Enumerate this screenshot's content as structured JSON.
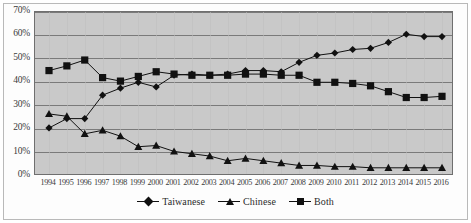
{
  "chart_data": {
    "type": "line",
    "title": "",
    "subtitle": "",
    "xlabel": "",
    "ylabel": "",
    "ylim": [
      0,
      70
    ],
    "ytick_step": 10,
    "ytick_labels": [
      "0%",
      "10%",
      "20%",
      "30%",
      "40%",
      "50%",
      "60%",
      "70%"
    ],
    "ytick_values": [
      0,
      10,
      20,
      30,
      40,
      50,
      60,
      70
    ],
    "grid": "horizontal",
    "legend_position": "bottom-center",
    "categories": [
      "1994",
      "1995",
      "1996",
      "1997",
      "1998",
      "1999",
      "2000",
      "2001",
      "2002",
      "2003",
      "2004",
      "2005",
      "2006",
      "2007",
      "2008",
      "2009",
      "2010",
      "2011",
      "2012",
      "2013",
      "2014",
      "2015",
      "2016"
    ],
    "x": [
      1994,
      1995,
      1996,
      1997,
      1998,
      1999,
      2000,
      2001,
      2002,
      2003,
      2004,
      2005,
      2006,
      2007,
      2008,
      2009,
      2010,
      2011,
      2012,
      2013,
      2014,
      2015,
      2016
    ],
    "series": [
      {
        "name": "Taiwanese",
        "marker": "diamond",
        "color": "#111111",
        "values": [
          20.5,
          24.5,
          24.5,
          34.5,
          37.5,
          40.0,
          38.0,
          43.0,
          43.5,
          43.0,
          43.5,
          45.0,
          45.0,
          44.5,
          48.5,
          51.5,
          52.5,
          54.0,
          54.5,
          57.0,
          60.5,
          59.5,
          59.5
        ]
      },
      {
        "name": "Chinese",
        "marker": "triangle",
        "color": "#111111",
        "values": [
          26.5,
          25.5,
          18.0,
          19.5,
          17.0,
          12.5,
          13.0,
          10.5,
          9.5,
          8.5,
          6.5,
          7.5,
          6.5,
          5.5,
          4.5,
          4.5,
          4.0,
          4.0,
          3.5,
          3.5,
          3.5,
          3.5,
          3.5
        ]
      },
      {
        "name": "Both",
        "marker": "square",
        "color": "#111111",
        "values": [
          45.0,
          47.0,
          49.5,
          42.0,
          40.5,
          42.5,
          44.5,
          43.5,
          43.0,
          43.0,
          43.0,
          43.5,
          43.5,
          43.0,
          43.0,
          40.0,
          40.0,
          39.5,
          38.5,
          36.0,
          33.5,
          33.5,
          34.0
        ]
      }
    ]
  },
  "legend": {
    "items": [
      {
        "label": "Taiwanese",
        "marker": "diamond"
      },
      {
        "label": "Chinese",
        "marker": "triangle"
      },
      {
        "label": "Both",
        "marker": "square"
      }
    ]
  },
  "colors": {
    "plot_background": "#c9c9c9",
    "figure_background": "#ffffff",
    "gridline": "#7a7a7a",
    "series": "#111111",
    "axis_text": "#3a3a3a"
  }
}
